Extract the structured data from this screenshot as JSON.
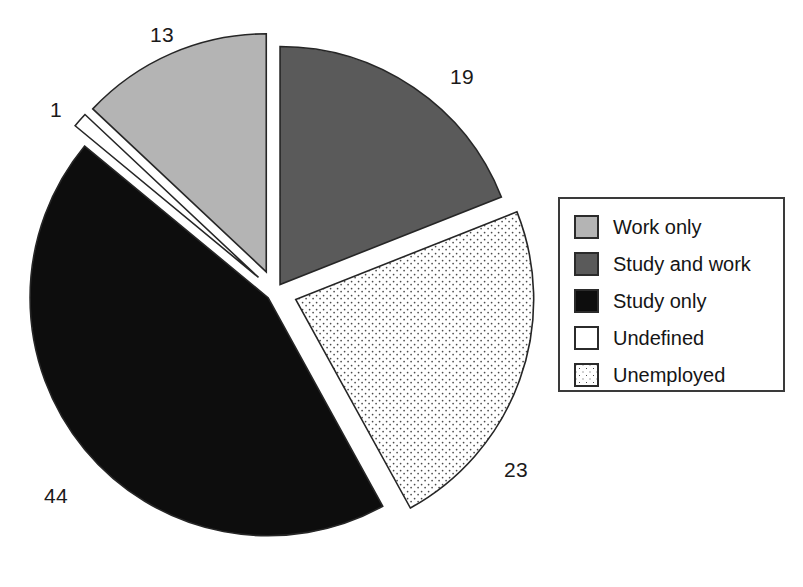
{
  "chart_data": {
    "type": "pie",
    "title": "",
    "total": 100,
    "units": "percent",
    "categories": [
      "Work only",
      "Study and work",
      "Study only",
      "Undefined",
      "Unemployed"
    ],
    "values": [
      13,
      19,
      44,
      1,
      23
    ],
    "start_angle_deg": 0,
    "direction": "clockwise",
    "legend_position": "right",
    "grid": false,
    "slices": [
      {
        "label": "Study and work",
        "value": 19,
        "value_text": "19",
        "color": "#5a5a5a",
        "pattern": "solid",
        "exploded": false,
        "label_x": 450,
        "label_y": 66
      },
      {
        "label": "Unemployed",
        "value": 23,
        "value_text": "23",
        "color": "#ffffff",
        "pattern": "dots",
        "exploded": true,
        "label_x": 504,
        "label_y": 459
      },
      {
        "label": "Study only",
        "value": 44,
        "value_text": "44",
        "color": "#0d0d0d",
        "pattern": "solid",
        "exploded": false,
        "label_x": 44,
        "label_y": 485
      },
      {
        "label": "Undefined",
        "value": 1,
        "value_text": "1",
        "color": "#ffffff",
        "pattern": "solid",
        "exploded": true,
        "label_x": 50,
        "label_y": 99
      },
      {
        "label": "Work only",
        "value": 13,
        "value_text": "13",
        "color": "#b4b4b4",
        "pattern": "solid",
        "exploded": true,
        "label_x": 150,
        "label_y": 24
      }
    ]
  },
  "legend": {
    "items": [
      {
        "label": "Work only",
        "swatch_color": "#b4b4b4",
        "swatch_pattern": "solid"
      },
      {
        "label": "Study and work",
        "swatch_color": "#5a5a5a",
        "swatch_pattern": "solid"
      },
      {
        "label": "Study only",
        "swatch_color": "#0d0d0d",
        "swatch_pattern": "solid"
      },
      {
        "label": "Undefined",
        "swatch_color": "#ffffff",
        "swatch_pattern": "solid"
      },
      {
        "label": "Unemployed",
        "swatch_color": "#ffffff",
        "swatch_pattern": "dots"
      }
    ]
  },
  "geometry": {
    "center_x": 275,
    "center_y": 292,
    "radius": 238,
    "outline_color": "#262626"
  }
}
